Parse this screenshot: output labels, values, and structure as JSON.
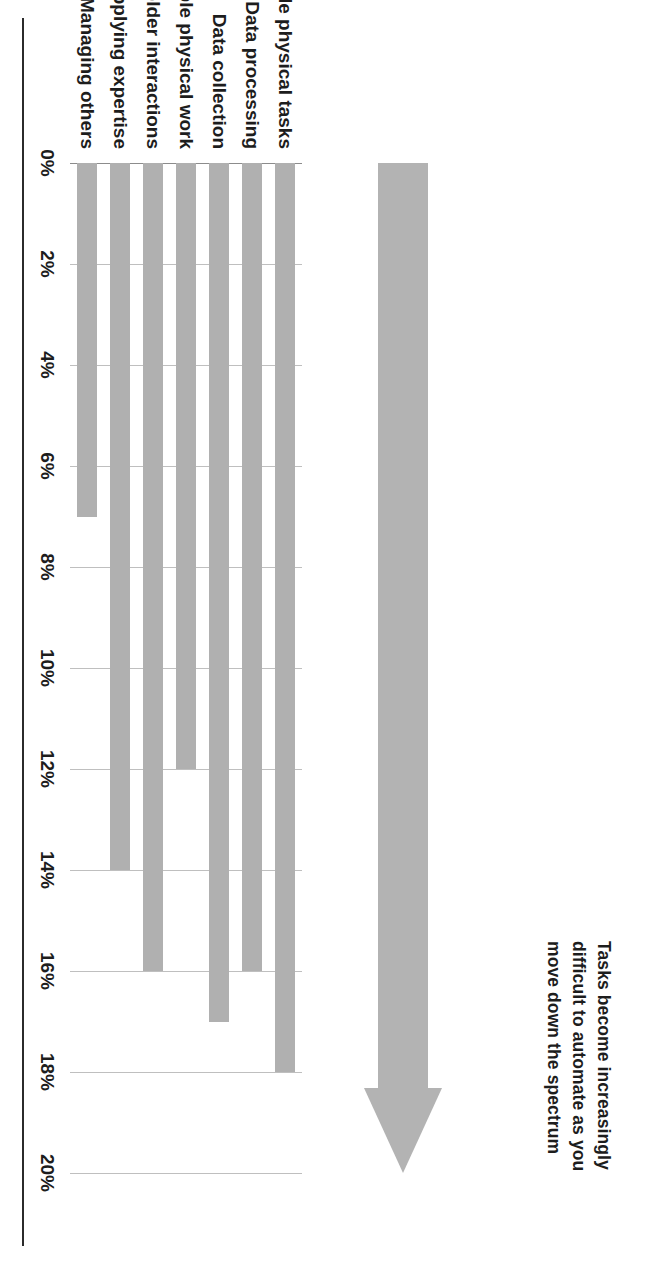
{
  "figure": {
    "annotation": "Tasks become increasingly difficult to automate as you move down the spectrum",
    "arrow_label": "spectrum-arrow",
    "arrow_color": "#b3b3b3",
    "bar_color": "#b0b0b0",
    "gridline_color": "#bfbfbf"
  },
  "chart_data": {
    "type": "bar",
    "orientation": "horizontal",
    "title": "",
    "subtitle": "",
    "xlabel": "",
    "ylabel": "",
    "categories": [
      "Predictable physical tasks",
      "Data processing",
      "Data collection",
      "Unpredictable physical work",
      "Stakeholder interactions",
      "Applying expertise",
      "Managing others"
    ],
    "values": [
      18,
      16,
      17,
      12,
      16,
      14,
      7
    ],
    "value_unit": "%",
    "xlim": [
      0,
      20
    ],
    "tick_values": [
      0,
      2,
      4,
      6,
      8,
      10,
      12,
      14,
      16,
      18,
      20
    ],
    "tick_labels": [
      "0%",
      "2%",
      "4%",
      "6%",
      "8%",
      "10%",
      "12%",
      "14%",
      "16%",
      "18%",
      "20%"
    ],
    "grid": true,
    "legend": false,
    "annotations": [
      "Tasks become increasingly difficult to automate as you move down the spectrum"
    ]
  }
}
